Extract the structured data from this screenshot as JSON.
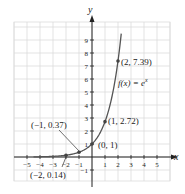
{
  "chart_data": {
    "type": "line",
    "title": "",
    "function_label": "f(x) = e^x",
    "xlabel": "x",
    "ylabel": "y",
    "xlim": [
      -5.5,
      5.9
    ],
    "ylim": [
      -1.8,
      10.5
    ],
    "grid": true,
    "x_ticks": [
      -5,
      -4,
      -3,
      -2,
      -1,
      1,
      2,
      3,
      4,
      5
    ],
    "y_ticks": [
      -1,
      1,
      2,
      3,
      4,
      5,
      6,
      7,
      8,
      9
    ],
    "points": [
      {
        "x": -2,
        "y": 0.14,
        "label": "(−2, 0.14)"
      },
      {
        "x": -1,
        "y": 0.37,
        "label": "(−1, 0.37)"
      },
      {
        "x": 0,
        "y": 1,
        "label": "(0, 1)"
      },
      {
        "x": 1,
        "y": 2.72,
        "label": "(1, 2.72)"
      },
      {
        "x": 2,
        "y": 7.39,
        "label": "(2, 7.39)"
      }
    ],
    "colors": {
      "curve": "#555555",
      "grid": "#d9d9d9",
      "axis": "#222222"
    }
  },
  "labels": {
    "x_axis": "x",
    "y_axis": "y",
    "function": "f(x) = e",
    "function_exp": "x",
    "p_neg2": "(−2, 0.14)",
    "p_neg1": "(−1, 0.37)",
    "p_0": "(0, 1)",
    "p_1": "(1, 2.72)",
    "p_2": "(2, 7.39)"
  }
}
